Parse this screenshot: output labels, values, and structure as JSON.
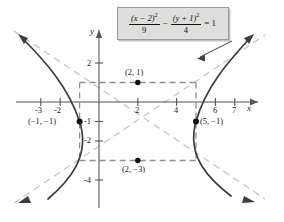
{
  "figure": {
    "type": "graph",
    "equation": {
      "left_numerator": "(x − 2)",
      "left_numerator_exp": "2",
      "left_denominator": "9",
      "operator": "−",
      "right_numerator": "(y + 1)",
      "right_numerator_exp": "2",
      "right_denominator": "4",
      "equals": "= 1",
      "plain": "(x-2)^2/9 - (y+1)^2/4 = 1"
    },
    "axes": {
      "x_label": "x",
      "y_label": "y",
      "x_ticks": [
        "-3",
        "-2",
        "2",
        "4",
        "6",
        "7"
      ],
      "x_tick_values": [
        -3,
        -2,
        2,
        4,
        6,
        7
      ],
      "y_ticks": [
        "2",
        "-1",
        "-2",
        "-4"
      ],
      "y_tick_values": [
        2,
        -1,
        -2,
        -4
      ],
      "xlim": [
        -4.3,
        8.5
      ],
      "ylim": [
        -5.0,
        3.3
      ],
      "origin_px": [
        99,
        102
      ],
      "unit_px": [
        19.4,
        19.5
      ]
    },
    "points": [
      {
        "label": "(2, 1)",
        "x": 2,
        "y": 1,
        "label_dx": -14,
        "label_dy": -14
      },
      {
        "label": "(−1, −1)",
        "x": -1,
        "y": -1,
        "label_dx": -50,
        "label_dy": -4
      },
      {
        "label": "(5, −1)",
        "x": 5,
        "y": -1,
        "label_dx": 5,
        "label_dy": -4
      },
      {
        "label": "(2, −3)",
        "x": 2,
        "y": -3,
        "label_dx": -16,
        "label_dy": 5
      }
    ],
    "rectangle": {
      "x_min": -1,
      "x_max": 5,
      "y_min": -3,
      "y_max": 1
    },
    "center": {
      "x": 2,
      "y": -1
    },
    "a": 3,
    "b": 2,
    "asymptote_slopes": [
      0.6667,
      -0.6667
    ]
  },
  "colors": {
    "curve": "#3d3d3d",
    "asymptote": "#c9c9c9",
    "dashed_box": "#8f8f8f",
    "axis": "#555555",
    "eq_box_fill": "#dededd",
    "eq_box_border": "#9a9a9a",
    "text": "#1a1a1a"
  }
}
